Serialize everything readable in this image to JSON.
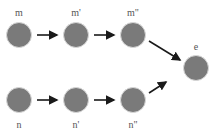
{
  "diagram": {
    "node_fill": "#7a7a7a",
    "node_stroke": "#eeeeee",
    "arrow_color": "#1a1a1a",
    "nodes": [
      {
        "id": "m",
        "label": "m",
        "cx": 19,
        "cy": 35
      },
      {
        "id": "m1",
        "label": "m'",
        "cx": 76,
        "cy": 35
      },
      {
        "id": "m2",
        "label": "m\"",
        "cx": 133,
        "cy": 35
      },
      {
        "id": "n",
        "label": "n",
        "cx": 19,
        "cy": 100
      },
      {
        "id": "n1",
        "label": "n'",
        "cx": 76,
        "cy": 100
      },
      {
        "id": "n2",
        "label": "n\"",
        "cx": 133,
        "cy": 100
      },
      {
        "id": "e",
        "label": "e",
        "cx": 196,
        "cy": 68
      }
    ],
    "edges": [
      {
        "from": "m",
        "to": "m1"
      },
      {
        "from": "m1",
        "to": "m2"
      },
      {
        "from": "m2",
        "to": "e"
      },
      {
        "from": "n",
        "to": "n1"
      },
      {
        "from": "n1",
        "to": "n2"
      },
      {
        "from": "n2",
        "to": "e"
      }
    ]
  }
}
